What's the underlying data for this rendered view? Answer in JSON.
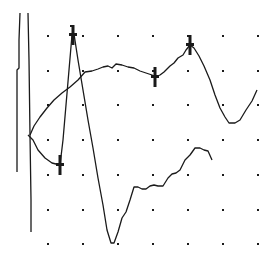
{
  "chart_data": {
    "type": "line",
    "title": "",
    "xlabel": "",
    "ylabel": "",
    "grid": "dotted",
    "legend": null,
    "grid_dots": {
      "columns_px": [
        48,
        83,
        118,
        153,
        188,
        223,
        258
      ],
      "rows_px": [
        36,
        71,
        105,
        140,
        175,
        210,
        244
      ]
    },
    "colors": {
      "line": "#1a1a1a",
      "background": "#ffffff",
      "grid": "#1a1a1a"
    },
    "series": [
      {
        "name": "trace-1",
        "points_px": [
          [
            30,
            135
          ],
          [
            34,
            126
          ],
          [
            40,
            117
          ],
          [
            47,
            108
          ],
          [
            54,
            100
          ],
          [
            62,
            93
          ],
          [
            70,
            87
          ],
          [
            78,
            80
          ],
          [
            85,
            72
          ],
          [
            92,
            71
          ],
          [
            98,
            69
          ],
          [
            103,
            67
          ],
          [
            108,
            66
          ],
          [
            112,
            68
          ],
          [
            116,
            64
          ],
          [
            122,
            65
          ],
          [
            128,
            67
          ],
          [
            134,
            68
          ],
          [
            140,
            71
          ],
          [
            146,
            73
          ],
          [
            152,
            75
          ],
          [
            155,
            77
          ],
          [
            160,
            75
          ],
          [
            164,
            72
          ],
          [
            170,
            66
          ],
          [
            174,
            63
          ],
          [
            178,
            58
          ],
          [
            183,
            55
          ],
          [
            186,
            50
          ],
          [
            190,
            45
          ],
          [
            194,
            48
          ],
          [
            199,
            56
          ],
          [
            204,
            66
          ],
          [
            210,
            80
          ],
          [
            215,
            95
          ],
          [
            220,
            108
          ],
          [
            225,
            117
          ],
          [
            229,
            123
          ],
          [
            235,
            123
          ],
          [
            240,
            120
          ],
          [
            246,
            110
          ],
          [
            252,
            101
          ],
          [
            257,
            90
          ]
        ]
      },
      {
        "name": "trace-2",
        "points_px": [
          [
            28,
            135
          ],
          [
            33,
            140
          ],
          [
            38,
            150
          ],
          [
            45,
            158
          ],
          [
            52,
            163
          ],
          [
            60,
            165
          ],
          [
            63,
            140
          ],
          [
            66,
            105
          ],
          [
            69,
            70
          ],
          [
            72,
            35
          ],
          [
            74,
            34
          ],
          [
            78,
            60
          ],
          [
            83,
            90
          ],
          [
            88,
            120
          ],
          [
            93,
            148
          ],
          [
            98,
            178
          ],
          [
            103,
            205
          ],
          [
            107,
            230
          ],
          [
            111,
            243
          ],
          [
            114,
            243
          ],
          [
            118,
            232
          ],
          [
            122,
            218
          ],
          [
            126,
            212
          ],
          [
            130,
            200
          ],
          [
            134,
            187
          ],
          [
            138,
            187
          ],
          [
            142,
            189
          ],
          [
            146,
            189
          ],
          [
            150,
            186
          ],
          [
            154,
            185
          ],
          [
            158,
            186
          ],
          [
            163,
            186
          ],
          [
            168,
            178
          ],
          [
            172,
            174
          ],
          [
            176,
            173
          ],
          [
            180,
            170
          ],
          [
            185,
            160
          ],
          [
            190,
            155
          ],
          [
            195,
            148
          ],
          [
            200,
            148
          ],
          [
            204,
            150
          ],
          [
            208,
            151
          ],
          [
            212,
            160
          ]
        ]
      },
      {
        "name": "trace-left-1",
        "points_px": [
          [
            20,
            13
          ],
          [
            19,
            40
          ],
          [
            19,
            68
          ],
          [
            17,
            70
          ],
          [
            17,
            172
          ]
        ]
      },
      {
        "name": "trace-left-2",
        "points_px": [
          [
            28,
            13
          ],
          [
            29,
            60
          ],
          [
            30,
            135
          ],
          [
            31,
            200
          ],
          [
            31,
            232
          ]
        ]
      }
    ],
    "markers": [
      {
        "label": "1",
        "x_px": 73,
        "y_px": 35,
        "type": "cross"
      },
      {
        "label": "",
        "x_px": 60,
        "y_px": 165,
        "type": "cross"
      },
      {
        "label": "",
        "x_px": 155,
        "y_px": 77,
        "type": "cross"
      },
      {
        "label": "1",
        "x_px": 190,
        "y_px": 45,
        "type": "cross"
      }
    ]
  }
}
